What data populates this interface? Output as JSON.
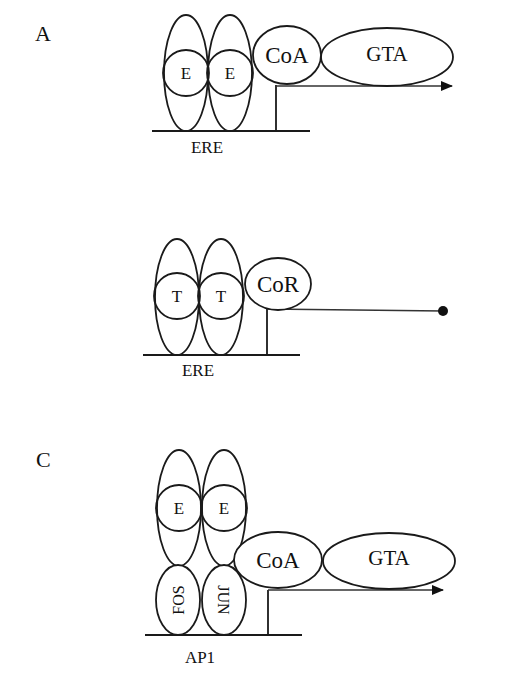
{
  "figure": {
    "background": "#ffffff",
    "stroke_color": "#1a1a1a"
  },
  "panels": {
    "A": {
      "letter": "A",
      "dimer": [
        "E",
        "E"
      ],
      "binding_site": "ERE",
      "cofactor": "CoA",
      "transcription_apparatus": "GTA",
      "outcome": "transcription (arrow)"
    },
    "B": {
      "letter": "",
      "dimer": [
        "T",
        "T"
      ],
      "binding_site": "ERE",
      "cofactor": "CoR",
      "outcome": "repression (line ending in dot)"
    },
    "C": {
      "letter": "C",
      "dimer": [
        "E",
        "E"
      ],
      "tethering_factors": [
        "FOS",
        "JUN"
      ],
      "binding_site": "AP1",
      "cofactor": "CoA",
      "transcription_apparatus": "GTA",
      "outcome": "transcription (arrow)"
    }
  }
}
